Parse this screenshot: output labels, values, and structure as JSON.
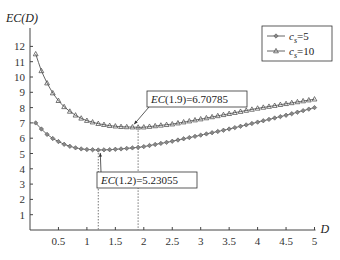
{
  "chart_data": {
    "type": "line",
    "title": "",
    "xlabel": "D",
    "ylabel": "EC(D)",
    "xlim": [
      0,
      5
    ],
    "ylim": [
      0,
      12.5
    ],
    "xticks": [
      0.5,
      1,
      1.5,
      2,
      2.5,
      3,
      3.5,
      4,
      4.5,
      5
    ],
    "xtick_labels": [
      "0.5",
      "1",
      "1.5",
      "2",
      "2.5",
      "3",
      "3.5",
      "4",
      "4.5",
      "5"
    ],
    "yticks": [
      1,
      2,
      3,
      4,
      5,
      6,
      7,
      8,
      9,
      10,
      11,
      12
    ],
    "ytick_labels": [
      "1",
      "2",
      "3",
      "4",
      "5",
      "6",
      "7",
      "8",
      "9",
      "10",
      "11",
      "12"
    ],
    "grid": false,
    "legend_position": "upper right",
    "x": [
      0.1,
      0.2,
      0.3,
      0.4,
      0.5,
      0.6,
      0.7,
      0.8,
      0.9,
      1.0,
      1.2,
      1.4,
      1.6,
      1.9,
      2.0,
      2.5,
      3.0,
      3.5,
      4.0,
      4.5,
      5.0
    ],
    "series": [
      {
        "name": "c_s=5",
        "label_main": "c",
        "label_sub": "s",
        "label_rest": "=5",
        "marker": "diamond",
        "values": [
          7.0,
          6.6,
          6.25,
          5.98,
          5.78,
          5.6,
          5.47,
          5.37,
          5.3,
          5.26,
          5.23,
          5.25,
          5.3,
          5.4,
          5.45,
          5.8,
          6.2,
          6.6,
          7.05,
          7.5,
          8.0
        ]
      },
      {
        "name": "c_s=10",
        "label_main": "c",
        "label_sub": "s",
        "label_rest": "=10",
        "marker": "triangle",
        "values": [
          11.5,
          10.4,
          9.6,
          8.95,
          8.45,
          8.05,
          7.75,
          7.5,
          7.3,
          7.15,
          6.95,
          6.82,
          6.75,
          6.71,
          6.72,
          6.92,
          7.25,
          7.6,
          7.95,
          8.25,
          8.55
        ]
      }
    ],
    "annotations": [
      {
        "text": "EC(1.9)=6.70785",
        "x": 1.9,
        "y": 6.70785,
        "series": "c_s=10"
      },
      {
        "text": "EC(1.2)=5.23055",
        "x": 1.2,
        "y": 5.23055,
        "series": "c_s=5"
      }
    ]
  },
  "colors": {
    "line": "#555555",
    "axis": "#444444",
    "marker_fill": "#888888",
    "dotted": "#777777"
  }
}
